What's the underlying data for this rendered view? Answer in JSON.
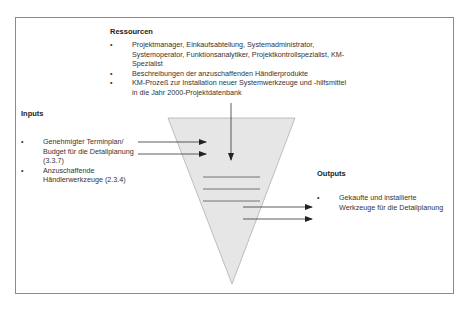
{
  "resources": {
    "heading": "Ressourcen",
    "items": [
      "Projektmanager, Einkaufsabteilung, Systemadministrator, Systemoperator, Funktionsanalytiker, Projektkontrollspezialist, KM-Spezialist",
      "Beschreibungen der anzuschaffenden Händlerprodukte",
      "KM-Prozeß zur Installation neuer Systemwerkzeuge und -hilfsmittel in die Jahr 2000-Projektdatenbank"
    ]
  },
  "inputs": {
    "heading": "Inputs",
    "items": [
      "Genehmigter Terminplan/ Budget für die Detailplanung (3.3.7)",
      "Anzuschaffende Händlerwerkzeuge (2.3.4)"
    ]
  },
  "outputs": {
    "heading": "Outputs",
    "items": [
      "Gekaufte und installierte Werkzeuge für die Detailplanung"
    ]
  },
  "bullet": "•",
  "colors": {
    "funnel_fill": "#e6e6e6",
    "funnel_stroke": "#b0b0b0",
    "line": "#333333",
    "frame": "#8a8a8a"
  }
}
